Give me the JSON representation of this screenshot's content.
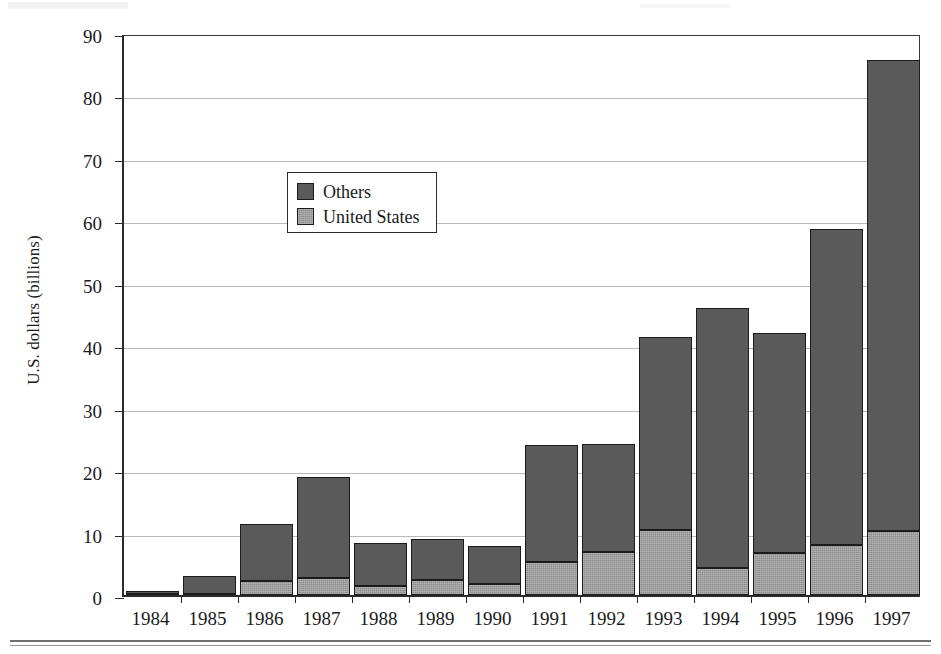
{
  "chart_data": {
    "type": "bar",
    "stacked": true,
    "title": "",
    "subtitle": "",
    "xlabel": "",
    "ylabel": "U.S. dollars (billions)",
    "categories": [
      "1984",
      "1985",
      "1986",
      "1987",
      "1988",
      "1989",
      "1990",
      "1991",
      "1992",
      "1993",
      "1994",
      "1995",
      "1996",
      "1997"
    ],
    "series": [
      {
        "name": "United States",
        "color": "#8d8d8d",
        "values": [
          0.2,
          0.1,
          2.2,
          2.7,
          1.5,
          2.4,
          1.8,
          5.3,
          6.9,
          10.4,
          4.3,
          6.7,
          8.0,
          10.3
        ]
      },
      {
        "name": "Others",
        "color": "#5a5a5a",
        "values": [
          0.5,
          2.9,
          9.2,
          16.2,
          6.9,
          6.5,
          6.0,
          18.7,
          17.3,
          30.9,
          41.7,
          35.3,
          50.6,
          75.3
        ]
      }
    ],
    "totals": [
      0.7,
      3.0,
      11.4,
      18.9,
      8.4,
      8.9,
      7.8,
      24.0,
      24.2,
      41.3,
      46.0,
      42.0,
      58.6,
      85.6
    ],
    "yticks": [
      0,
      10,
      20,
      30,
      40,
      50,
      60,
      70,
      80,
      90
    ],
    "ylim": [
      0,
      90
    ],
    "grid": true,
    "legend_position": "upper-left-inset",
    "legend_entries": [
      "Others",
      "United States"
    ]
  },
  "legend": {
    "others_label": "Others",
    "united_states_label": "United States"
  },
  "axes": {
    "y_axis_title": "U.S. dollars (billions)"
  }
}
